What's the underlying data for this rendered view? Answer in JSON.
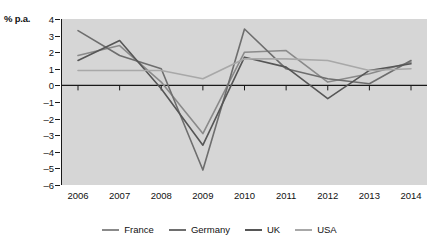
{
  "chart_data": {
    "type": "line",
    "title": "",
    "xlabel": "",
    "ylabel": "% p.a.",
    "categories": [
      "2006",
      "2007",
      "2008",
      "2009",
      "2010",
      "2011",
      "2012",
      "2013",
      "2014"
    ],
    "x": [
      2006,
      2007,
      2008,
      2009,
      2010,
      2011,
      2012,
      2013,
      2014
    ],
    "ylim": [
      -6,
      4
    ],
    "yticks": [
      4,
      3,
      2,
      1,
      0,
      -1,
      -2,
      -3,
      -4,
      -5,
      -6
    ],
    "ytick_labels": [
      "4",
      "3",
      "2",
      "1",
      "0",
      "-1",
      "-2",
      "-3",
      "-4",
      "-5",
      "-6"
    ],
    "grid": false,
    "zero_line": true,
    "legend_position": "bottom",
    "plot_background": "#d6d6d6",
    "series": [
      {
        "name": "France",
        "color": "#8a8a8a",
        "values": [
          1.8,
          2.4,
          0.2,
          -2.9,
          2.0,
          2.1,
          0.2,
          0.7,
          1.4
        ]
      },
      {
        "name": "Germany",
        "color": "#6e6e6e",
        "values": [
          3.3,
          1.8,
          1.0,
          -5.1,
          3.4,
          1.0,
          0.4,
          0.1,
          1.5
        ]
      },
      {
        "name": "UK",
        "color": "#565656",
        "values": [
          1.5,
          2.7,
          -0.2,
          -3.6,
          1.7,
          1.1,
          -0.8,
          0.9,
          1.3
        ]
      },
      {
        "name": "USA",
        "color": "#a8a8a8",
        "values": [
          0.9,
          0.9,
          0.9,
          0.4,
          1.6,
          1.6,
          1.5,
          0.9,
          1.0
        ]
      }
    ]
  },
  "legend": {
    "items": [
      {
        "label": "France"
      },
      {
        "label": "Germany"
      },
      {
        "label": "UK"
      },
      {
        "label": "USA"
      }
    ]
  }
}
